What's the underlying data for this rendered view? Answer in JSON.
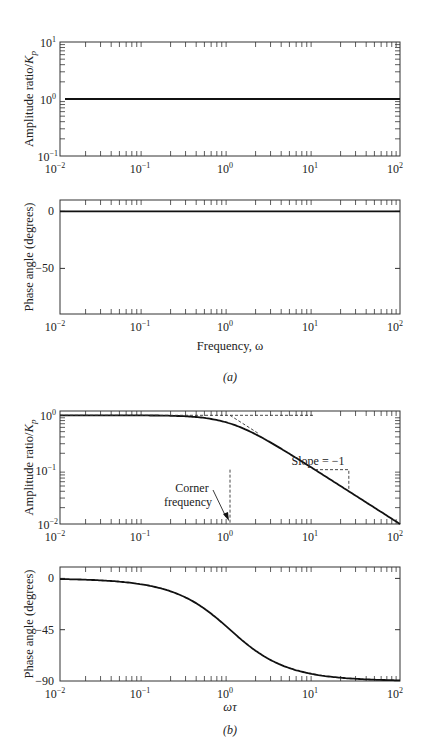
{
  "chart_data": [
    {
      "id": "a-amplitude",
      "type": "line",
      "panel": "(a)",
      "xscale": "log",
      "yscale": "log",
      "xlim": [
        0.01,
        100
      ],
      "ylim": [
        0.1,
        10
      ],
      "xticks": [
        "10^-2",
        "10^-1",
        "10^0",
        "10^1",
        "10^2"
      ],
      "yticks": [
        "10^-1",
        "10^0",
        "10^1"
      ],
      "ylabel": "Amplitude ratio/K_p",
      "series": [
        {
          "name": "AR/Kp",
          "x": [
            0.01,
            100
          ],
          "y": [
            1,
            1
          ]
        }
      ]
    },
    {
      "id": "a-phase",
      "type": "line",
      "panel": "(a)",
      "xscale": "log",
      "yscale": "linear",
      "xlim": [
        0.01,
        100
      ],
      "ylim": [
        -90,
        10
      ],
      "xticks": [
        "10^-2",
        "10^-1",
        "10^0",
        "10^1",
        "10^2"
      ],
      "yticks": [
        "0",
        "-50"
      ],
      "ylabel": "Phase angle (degrees)",
      "xlabel": "Frequency, ω",
      "series": [
        {
          "name": "phase",
          "x": [
            0.01,
            100
          ],
          "y": [
            0,
            0
          ]
        }
      ]
    },
    {
      "id": "b-amplitude",
      "type": "line",
      "panel": "(b)",
      "xscale": "log",
      "yscale": "log",
      "xlim": [
        0.01,
        100
      ],
      "ylim": [
        0.01,
        1.2
      ],
      "xticks": [
        "10^-2",
        "10^-1",
        "10^0",
        "10^1",
        "10^2"
      ],
      "yticks": [
        "10^-2",
        "10^-1",
        "10^0"
      ],
      "ylabel": "Amplitude ratio/K_p",
      "series": [
        {
          "name": "AR/Kp = 1/sqrt(1+(ωτ)^2)",
          "x": [
            0.01,
            0.1,
            0.3,
            1,
            3,
            10,
            30,
            100
          ],
          "y": [
            1,
            0.995,
            0.958,
            0.707,
            0.316,
            0.0995,
            0.0333,
            0.01
          ]
        }
      ],
      "asymptotes": [
        {
          "x": [
            0.01,
            10
          ],
          "y": [
            1,
            1
          ]
        },
        {
          "x": [
            1,
            100
          ],
          "y": [
            1,
            0.01
          ]
        }
      ],
      "annotations": [
        {
          "text": "Corner",
          "x": 1,
          "note": "arrow to ωτ=1"
        },
        {
          "text": "frequency"
        },
        {
          "text": "Slope = −1"
        }
      ]
    },
    {
      "id": "b-phase",
      "type": "line",
      "panel": "(b)",
      "xscale": "log",
      "yscale": "linear",
      "xlim": [
        0.01,
        100
      ],
      "ylim": [
        -90,
        10
      ],
      "xticks": [
        "10^-2",
        "10^-1",
        "10^0",
        "10^1",
        "10^2"
      ],
      "yticks": [
        "0",
        "-45",
        "-90"
      ],
      "ylabel": "Phase angle (degrees)",
      "xlabel": "ωτ",
      "series": [
        {
          "name": "phase = -atan(ωτ)",
          "x": [
            0.01,
            0.1,
            0.3,
            1,
            3,
            10,
            30,
            100
          ],
          "y": [
            -0.6,
            -5.7,
            -16.7,
            -45,
            -71.6,
            -84.3,
            -88.1,
            -89.4
          ]
        }
      ]
    }
  ],
  "labels": {
    "amp_ylabel": "Amplitude ratio/",
    "amp_ylabel_k": "K",
    "amp_ylabel_sub": "p",
    "phase_ylabel": "Phase angle (degrees)",
    "a_xlabel": "Frequency, ω",
    "b_xlabel": "ωτ",
    "panel_a": "(a)",
    "panel_b": "(b)",
    "corner1": "Corner",
    "corner2": "frequency",
    "slope": "Slope = −1",
    "tick_0": "0",
    "tick_m50": "−50",
    "tick_m45": "−45",
    "tick_m90": "−90"
  }
}
